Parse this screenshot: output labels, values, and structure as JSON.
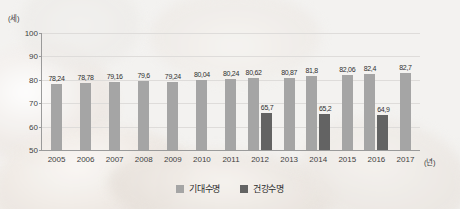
{
  "chart_data": {
    "type": "bar",
    "title": "",
    "xlabel": "(년)",
    "ylabel": "(세)",
    "ylim": [
      50,
      100
    ],
    "yticks": [
      100,
      90,
      80,
      70,
      60,
      50
    ],
    "grid": true,
    "legend_position": "bottom",
    "categories": [
      "2005",
      "2006",
      "2007",
      "2008",
      "2009",
      "2010",
      "2011",
      "2012",
      "2013",
      "2014",
      "2015",
      "2016",
      "2017"
    ],
    "series": [
      {
        "name": "기대수명",
        "color": "#a5a5a5",
        "values": [
          78.24,
          78.78,
          79.16,
          79.6,
          79.24,
          80.04,
          80.24,
          80.62,
          80.87,
          81.8,
          82.06,
          82.4,
          82.7
        ],
        "labels": [
          "78,24",
          "78,78",
          "79,16",
          "79,6",
          "79,24",
          "80,04",
          "80,24",
          "80,62",
          "80,87",
          "81,8",
          "82,06",
          "82,4",
          "82,7"
        ]
      },
      {
        "name": "건강수명",
        "color": "#636363",
        "values": [
          null,
          null,
          null,
          null,
          null,
          null,
          null,
          65.7,
          null,
          65.2,
          null,
          64.9,
          null
        ],
        "labels": [
          "",
          "",
          "",
          "",
          "",
          "",
          "",
          "65,7",
          "",
          "65,2",
          "",
          "64,9",
          ""
        ]
      }
    ]
  },
  "axis": {
    "y_unit": "(세)",
    "x_unit": "(년)"
  },
  "legend": {
    "items": [
      {
        "label": "기대수명",
        "color": "#a5a5a5"
      },
      {
        "label": "건강수명",
        "color": "#636363"
      }
    ]
  }
}
